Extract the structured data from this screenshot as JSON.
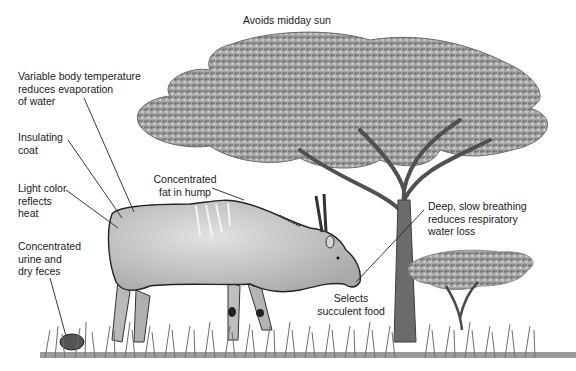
{
  "figure": {
    "labels": {
      "sun": {
        "lines": [
          "Avoids midday sun"
        ]
      },
      "temperature": {
        "lines": [
          "Variable body temperature",
          "reduces evaporation",
          "of water"
        ]
      },
      "coat": {
        "lines": [
          "Insulating",
          "coat"
        ]
      },
      "color": {
        "lines": [
          "Light color",
          "reflects",
          "heat"
        ]
      },
      "urine": {
        "lines": [
          "Concentrated",
          "urine and",
          "dry feces"
        ]
      },
      "hump": {
        "lines": [
          "Concentrated",
          "fat in hump"
        ]
      },
      "breathing": {
        "lines": [
          "Deep, slow breathing",
          "reduces respiratory",
          "water loss"
        ]
      },
      "food": {
        "lines": [
          "Selects",
          "succulent food"
        ]
      }
    },
    "colors": {
      "text": "#1a1a1a",
      "leader_line": "#222222",
      "animal_body": "#cfcfcf",
      "foliage": "#8a8a8a",
      "trunk": "#555555",
      "grass": "#777777"
    }
  }
}
